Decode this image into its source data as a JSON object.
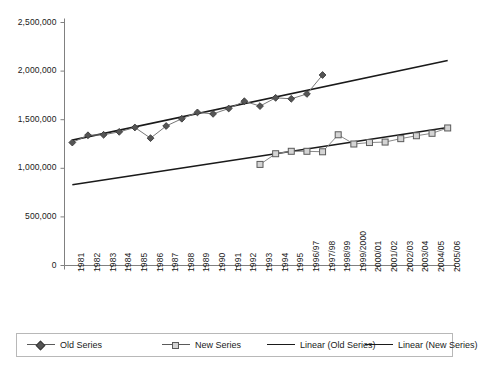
{
  "chart_data": {
    "type": "line",
    "title": "",
    "subtitle": "",
    "xlabel": "",
    "ylabel": "",
    "ylim": [
      0,
      2500000
    ],
    "grid": false,
    "legend_position": "bottom",
    "y_ticks": [
      "0",
      "500,000",
      "1,000,000",
      "1,500,000",
      "2,000,000",
      "2,500,000"
    ],
    "y_tick_values": [
      0,
      500000,
      1000000,
      1500000,
      2000000,
      2500000
    ],
    "categories": [
      "1981",
      "1982",
      "1983",
      "1984",
      "1985",
      "1986",
      "1987",
      "1988",
      "1989",
      "1990",
      "1991",
      "1992",
      "1993",
      "1994",
      "1995",
      "1996/97",
      "1997/98",
      "1998/99",
      "1999/2000",
      "2000/01",
      "2001/02",
      "2002/03",
      "2003/04",
      "2004/05",
      "2005/06"
    ],
    "series": [
      {
        "name": "Old Series",
        "marker": "diamond",
        "color": "#555555",
        "line_color": "#777777",
        "values": [
          1265000,
          1340000,
          1345000,
          1375000,
          1420000,
          1310000,
          1435000,
          1510000,
          1575000,
          1560000,
          1615000,
          1690000,
          1640000,
          1725000,
          1715000,
          1765000,
          1960000,
          null,
          null,
          null,
          null,
          null,
          null,
          null,
          null
        ]
      },
      {
        "name": "New Series",
        "marker": "square",
        "color": "#d4d4d4",
        "line_color": "#888888",
        "values": [
          null,
          null,
          null,
          null,
          null,
          null,
          null,
          null,
          null,
          null,
          null,
          null,
          1040000,
          1150000,
          1175000,
          1175000,
          1170000,
          1345000,
          1250000,
          1265000,
          1270000,
          1305000,
          1335000,
          1360000,
          1415000
        ]
      }
    ],
    "trendlines": [
      {
        "name": "Linear (Old Series)",
        "color": "#1a1a1a",
        "start": {
          "category_index": 0,
          "value": 1290000
        },
        "end": {
          "category_index": 24,
          "value": 2110000
        }
      },
      {
        "name": "Linear (New Series)",
        "color": "#1a1a1a",
        "start": {
          "category_index": 0,
          "value": 830000
        },
        "end": {
          "category_index": 24,
          "value": 1420000
        }
      }
    ],
    "legend": [
      {
        "label": "Old Series",
        "swatch": "line-diamond-marker"
      },
      {
        "label": "New Series",
        "swatch": "line-square-marker"
      },
      {
        "label": "Linear (Old Series)",
        "swatch": "solid-line"
      },
      {
        "label": "Linear (New Series)",
        "swatch": "solid-line"
      }
    ],
    "colors": {
      "axis": "#808080",
      "trendline": "#1a1a1a",
      "old_series_marker": "#555555",
      "new_series_marker": "#d4d4d4",
      "legend_border": "#b8b8b8",
      "background": "#ffffff"
    }
  }
}
